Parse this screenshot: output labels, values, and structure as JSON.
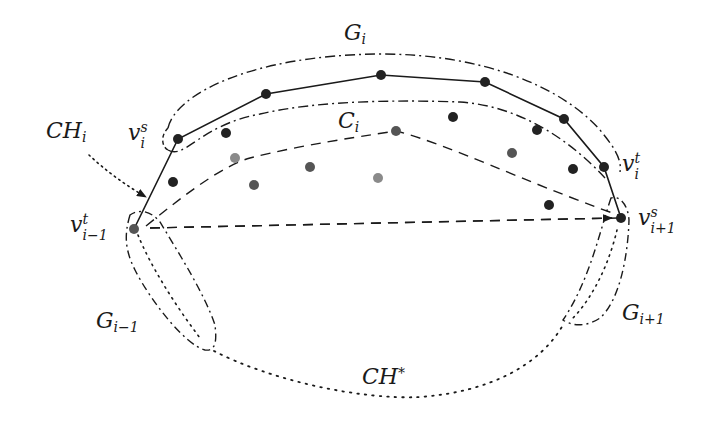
{
  "diagram": {
    "type": "geometric-convex-hull-groups",
    "colors": {
      "stroke": "#1a1a1a",
      "point_dark": "#222222",
      "point_mid": "#555555",
      "point_light": "#8a8a8a"
    },
    "labels": {
      "G_i": {
        "base": "G",
        "sub": "i"
      },
      "C_i": {
        "base": "C",
        "sub": "i"
      },
      "CH_i": {
        "base": "CH",
        "sub": "i"
      },
      "v_i_s": {
        "base": "v",
        "sub": "i",
        "sup": "s"
      },
      "v_i_t": {
        "base": "v",
        "sub": "i",
        "sup": "t"
      },
      "v_im1_t": {
        "base": "v",
        "sub": "i−1",
        "sup": "t"
      },
      "v_ip1_s": {
        "base": "v",
        "sub": "i+1",
        "sup": "s"
      },
      "G_im1": {
        "base": "G",
        "sub": "i−1"
      },
      "G_ip1": {
        "base": "G",
        "sub": "i+1"
      },
      "CH_star": {
        "base": "CH",
        "sup": "*"
      }
    },
    "hull_polyline": [
      [
        134,
        229
      ],
      [
        178,
        139
      ],
      [
        266,
        94
      ],
      [
        381,
        75
      ],
      [
        485,
        82
      ],
      [
        564,
        119
      ],
      [
        604,
        167
      ],
      [
        621,
        218
      ]
    ],
    "points_dark": [
      [
        178,
        139
      ],
      [
        266,
        94
      ],
      [
        381,
        75
      ],
      [
        485,
        82
      ],
      [
        564,
        119
      ],
      [
        604,
        167
      ],
      [
        621,
        218
      ],
      [
        226,
        133
      ],
      [
        173,
        182
      ],
      [
        453,
        117
      ],
      [
        537,
        130
      ],
      [
        573,
        169
      ],
      [
        549,
        205
      ]
    ],
    "points_mid": [
      [
        134,
        229
      ],
      [
        254,
        185
      ],
      [
        310,
        167
      ],
      [
        396,
        131
      ],
      [
        512,
        153
      ]
    ],
    "points_light": [
      [
        235,
        158
      ],
      [
        378,
        178
      ]
    ]
  }
}
